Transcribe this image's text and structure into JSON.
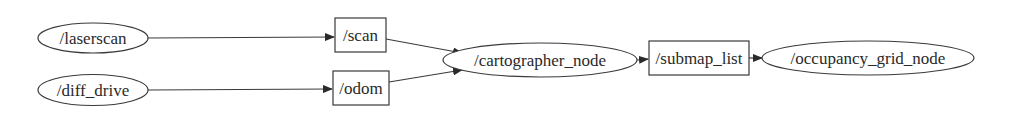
{
  "graph": {
    "type": "ros-node-topic-graph",
    "nodes": [
      {
        "id": "laserscan",
        "label": "/laserscan",
        "shape": "ellipse"
      },
      {
        "id": "diff_drive",
        "label": "/diff_drive",
        "shape": "ellipse"
      },
      {
        "id": "scan",
        "label": "/scan",
        "shape": "box"
      },
      {
        "id": "odom",
        "label": "/odom",
        "shape": "box"
      },
      {
        "id": "cartographer_node",
        "label": "/cartographer_node",
        "shape": "ellipse"
      },
      {
        "id": "submap_list",
        "label": "/submap_list",
        "shape": "box"
      },
      {
        "id": "occupancy_grid_node",
        "label": "/occupancy_grid_node",
        "shape": "ellipse"
      }
    ],
    "edges": [
      {
        "from": "laserscan",
        "to": "scan"
      },
      {
        "from": "diff_drive",
        "to": "odom"
      },
      {
        "from": "scan",
        "to": "cartographer_node"
      },
      {
        "from": "odom",
        "to": "cartographer_node"
      },
      {
        "from": "cartographer_node",
        "to": "submap_list"
      },
      {
        "from": "submap_list",
        "to": "occupancy_grid_node"
      }
    ]
  },
  "colors": {
    "stroke": "#3a3a3a",
    "text": "#2a2a2a",
    "background": "#ffffff"
  }
}
